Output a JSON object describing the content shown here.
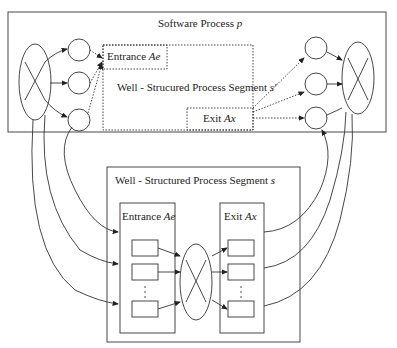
{
  "diagram": {
    "top_box": {
      "title": "Software Process",
      "title_var": "p",
      "inner_segment": {
        "label": "Well - Strucured Process Segment",
        "var": "s'",
        "entrance_label": "Entrance",
        "entrance_var": "Ae",
        "exit_label": "Exit",
        "exit_var": "Ax"
      }
    },
    "bottom_box": {
      "title": "Well - Structured Process Segment",
      "title_var": "s",
      "entrance_label": "Entrance",
      "entrance_var": "Ae",
      "exit_label": "Exit",
      "exit_var": "Ax",
      "ellipsis": "⋮"
    },
    "colors": {
      "stroke": "#333333",
      "background": "#ffffff"
    }
  }
}
